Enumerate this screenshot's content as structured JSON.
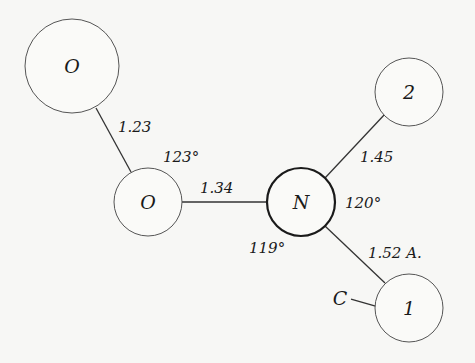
{
  "diagram": {
    "type": "molecular-structure",
    "atoms": [
      {
        "id": "o_top",
        "label": "O",
        "x": 72,
        "y": 66,
        "r": 47
      },
      {
        "id": "o_mid",
        "label": "O",
        "x": 148,
        "y": 202,
        "r": 34
      },
      {
        "id": "n",
        "label": "N",
        "x": 301,
        "y": 202,
        "r": 34
      },
      {
        "id": "c2",
        "label": "2",
        "x": 409,
        "y": 92,
        "r": 34
      },
      {
        "id": "c1",
        "label": "1",
        "x": 409,
        "y": 308,
        "r": 34
      },
      {
        "id": "c_ext",
        "label": "C"
      }
    ],
    "bonds": [
      {
        "from": "o_top",
        "to": "o_mid",
        "length": "1.23"
      },
      {
        "from": "o_mid",
        "to": "n",
        "length": "1.34"
      },
      {
        "from": "n",
        "to": "c2",
        "length": "1.45"
      },
      {
        "from": "n",
        "to": "c1",
        "length": "1.52 A."
      },
      {
        "from": "c_ext",
        "to": "c1",
        "length": ""
      }
    ],
    "angles": [
      {
        "at": "o_mid",
        "value": "123°"
      },
      {
        "at": "n",
        "value": "120°"
      },
      {
        "at": "n_lower",
        "value": "119°"
      }
    ]
  }
}
